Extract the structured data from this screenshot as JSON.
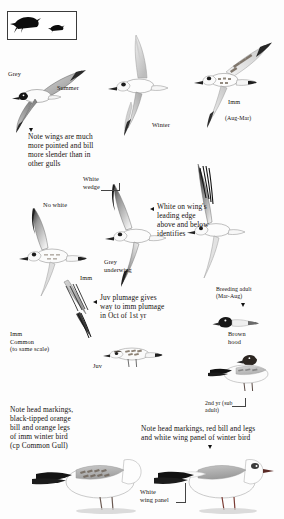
{
  "plate": {
    "title": "Black-headed Gull identification plate",
    "background": "#fdfdfd",
    "ink": "#15120f"
  },
  "size_box": {
    "name": "size-comparison-box",
    "large_bird": "large black bird silhouette",
    "small_bird": "small black bird silhouette"
  },
  "labels": {
    "grey": "Grey",
    "summer": "Summer",
    "winter": "Winter",
    "imm": "Imm",
    "imm_months": "(Aug-Mar)",
    "note_wings": "Note wings are much\nmore pointed and bill\nmore slender than in\nother gulls",
    "white_wedge": "White\nwedge",
    "no_white": "No white",
    "white_leading_edge": "White on wing's\nleading edge\nabove and below\nidentifies",
    "grey_underwing": "Grey\nunderwing",
    "imm_mid": "Imm",
    "juv_plumage": "Juv plumage gives\nway to imm plumage\nin Oct of 1st yr",
    "breeding_adult": "Breeding adult\n(Mar-Aug)",
    "brown_hood": "Brown\nhood",
    "imm_common": "Imm\nCommon\n(to same scale)",
    "juv": "Juv",
    "second_year": "2nd yr (sub\nadult)",
    "note_head_left": "Note head markings,\nblack-tipped orange\nbill and orange legs\nof imm winter bird\n(cp Common Gull)",
    "note_head_right": "Note head markings, red bill and legs\nand white wing panel of winter bird",
    "white_wing_panel": "White\nwing panel"
  },
  "birds": {
    "summer_adult_flight": "summer-adult-in-flight",
    "winter_adult_flight": "winter-adult-in-flight",
    "immature_flight": "immature-in-flight",
    "underwing_left": "immature-underwing-left",
    "underwing_mid": "adult-underwing-middle",
    "underwing_right": "adult-underwing-right",
    "imm_common_gull": "immature-common-gull",
    "juv_standing": "juvenile-standing",
    "breeding_adult_standing": "breeding-adult-standing",
    "second_year_standing": "second-year-standing",
    "winter_imm_standing": "winter-immature-standing",
    "winter_adult_standing": "winter-adult-standing"
  }
}
